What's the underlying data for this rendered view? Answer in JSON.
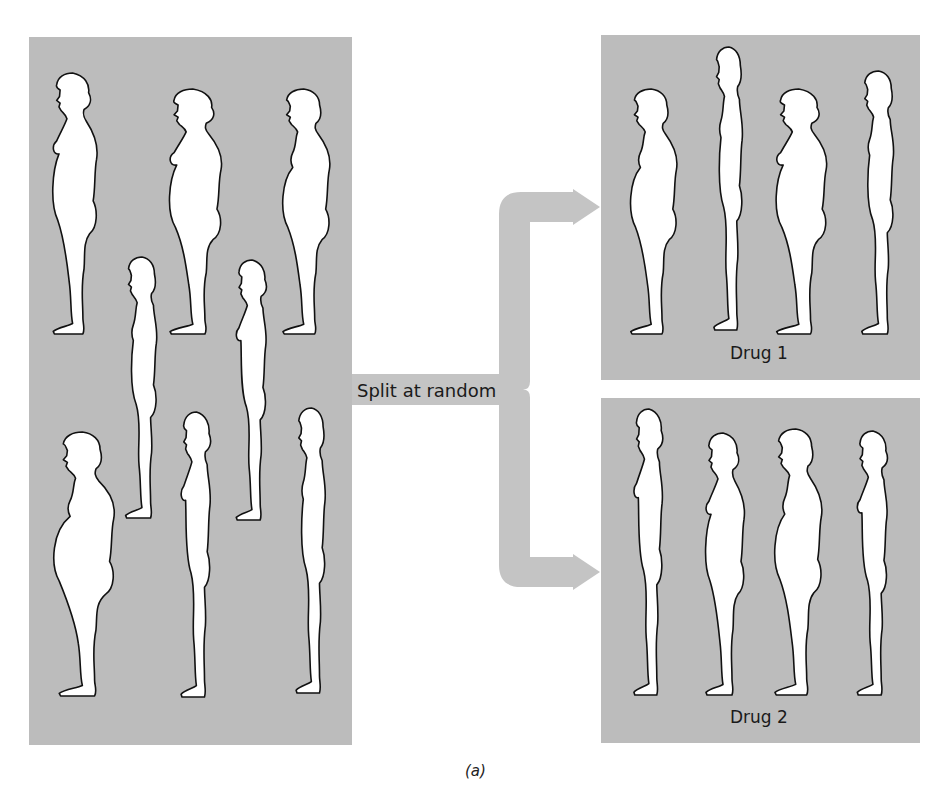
{
  "figure_caption": "(a)",
  "split_label": "Split at random",
  "colors": {
    "panel": "#bcbcbc",
    "connector": "#c4c4c4",
    "figure_fill": "#ffffff",
    "figure_outline": "#111111",
    "text": "#1a1a1a"
  },
  "panels": [
    {
      "id": "population",
      "label": "",
      "rect": {
        "x": 29,
        "y": 37,
        "w": 323,
        "h": 708
      },
      "people": [
        {
          "sex": "female",
          "build": "heavy",
          "box": [
            43,
            73,
            57,
            261
          ]
        },
        {
          "sex": "female",
          "build": "heavy",
          "box": [
            158,
            89,
            67,
            245
          ]
        },
        {
          "sex": "male",
          "build": "heavy",
          "box": [
            272,
            89,
            61,
            245
          ]
        },
        {
          "sex": "male",
          "build": "slim",
          "box": [
            117,
            257,
            48,
            261
          ]
        },
        {
          "sex": "female",
          "build": "slim",
          "box": [
            228,
            260,
            46,
            260
          ]
        },
        {
          "sex": "male",
          "build": "very-heavy",
          "box": [
            47,
            432,
            68,
            264
          ]
        },
        {
          "sex": "female",
          "build": "slim",
          "box": [
            173,
            412,
            45,
            285
          ]
        },
        {
          "sex": "male",
          "build": "slim",
          "box": [
            288,
            408,
            45,
            285
          ]
        }
      ]
    },
    {
      "id": "drug-1",
      "label": "Drug 1",
      "label_pos": {
        "x": 730,
        "y": 343
      },
      "rect": {
        "x": 601,
        "y": 35,
        "w": 319,
        "h": 345
      },
      "people": [
        {
          "sex": "male",
          "build": "heavy",
          "box": [
            620,
            89,
            60,
            245
          ]
        },
        {
          "sex": "male",
          "build": "slim",
          "box": [
            706,
            47,
            44,
            283
          ]
        },
        {
          "sex": "female",
          "build": "heavy",
          "box": [
            765,
            89,
            65,
            245
          ]
        },
        {
          "sex": "male",
          "build": "slim",
          "box": [
            853,
            71,
            49,
            263
          ]
        }
      ]
    },
    {
      "id": "drug-2",
      "label": "Drug 2",
      "label_pos": {
        "x": 730,
        "y": 707
      },
      "rect": {
        "x": 601,
        "y": 398,
        "w": 319,
        "h": 345
      },
      "people": [
        {
          "sex": "female",
          "build": "slim",
          "box": [
            626,
            409,
            44,
            286
          ]
        },
        {
          "sex": "female",
          "build": "heavy",
          "box": [
            697,
            433,
            50,
            262
          ]
        },
        {
          "sex": "male",
          "build": "heavy",
          "box": [
            764,
            429,
            61,
            266
          ]
        },
        {
          "sex": "female",
          "build": "slim",
          "box": [
            849,
            431,
            46,
            264
          ]
        }
      ]
    }
  ],
  "connector": {
    "bar_y": [
      374,
      405
    ],
    "trunk_x": [
      499,
      530
    ],
    "arrow_targets_y": [
      207,
      572
    ],
    "arrow_tip_x": 600
  }
}
